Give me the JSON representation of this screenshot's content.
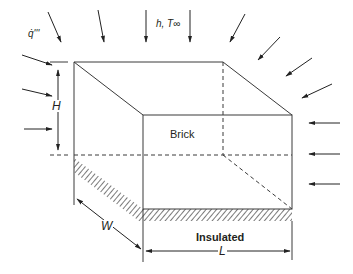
{
  "figure": {
    "type": "diagram",
    "colors": {
      "line": "#3a3a3a",
      "text": "#231f20",
      "background": "#ffffff"
    }
  },
  "labels": {
    "heat_generation": "q̇'''",
    "convection": "h, T∞",
    "material": "Brick",
    "insulated": "Insulated",
    "height": "H",
    "width": "W",
    "length": "L"
  },
  "arrows": {
    "top": 4,
    "top_right_diagonal": 4,
    "left": 3,
    "right": 3
  }
}
